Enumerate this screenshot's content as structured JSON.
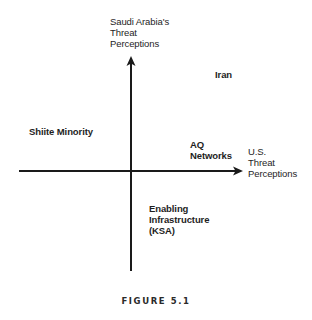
{
  "diagram": {
    "y_axis_label": [
      "Saudi Arabia's",
      "Threat",
      "Perceptions"
    ],
    "x_axis_label": [
      "U.S.",
      "Threat",
      "Perceptions"
    ],
    "quadrant_items": [
      {
        "id": "iran",
        "lines": [
          "Iran"
        ],
        "quadrant": "upper-right"
      },
      {
        "id": "shiite-minority",
        "lines": [
          "Shiite Minority"
        ],
        "quadrant": "upper-left"
      },
      {
        "id": "aq-networks",
        "lines": [
          "AQ",
          "Networks"
        ],
        "quadrant": "upper-right"
      },
      {
        "id": "enabling-infrastructure",
        "lines": [
          "Enabling",
          "Infrastructure",
          "(KSA)"
        ],
        "quadrant": "lower-right"
      }
    ],
    "caption": "FIGURE 5.1",
    "colors": {
      "axis": "#1a1a1a",
      "text": "#1e1e1e",
      "background": "#ffffff"
    }
  }
}
